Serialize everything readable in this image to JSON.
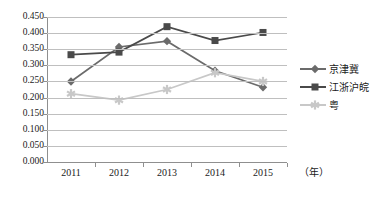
{
  "chart_data": {
    "type": "line",
    "title": "",
    "xlabel": "（年）",
    "ylabel": "",
    "categories": [
      "2011",
      "2012",
      "2013",
      "2014",
      "2015"
    ],
    "ylim": [
      0.0,
      0.45
    ],
    "ytick_labels": [
      "0.450",
      "0.400",
      "0.350",
      "0.300",
      "0.250",
      "0.200",
      "0.150",
      "0.100",
      "0.050",
      "0.000"
    ],
    "ytick_values": [
      0.45,
      0.4,
      0.35,
      0.3,
      0.25,
      0.2,
      0.15,
      0.1,
      0.05,
      0.0
    ],
    "grid": true,
    "legend_position": "right",
    "series": [
      {
        "name": "京津冀",
        "marker": "diamond",
        "color": "#6b6b6b",
        "values": [
          0.25,
          0.357,
          0.375,
          0.283,
          0.232
        ]
      },
      {
        "name": "江浙沪皖",
        "marker": "square",
        "color": "#4a4a4a",
        "values": [
          0.333,
          0.341,
          0.42,
          0.377,
          0.402
        ]
      },
      {
        "name": "粤",
        "marker": "star",
        "color": "#c8c8c8",
        "values": [
          0.212,
          0.192,
          0.225,
          0.277,
          0.25
        ]
      }
    ]
  },
  "axis": {
    "y_labels": [
      "0.450",
      "0.400",
      "0.350",
      "0.300",
      "0.250",
      "0.200",
      "0.150",
      "0.100",
      "0.050",
      "0.000"
    ],
    "x_labels": [
      "2011",
      "2012",
      "2013",
      "2014",
      "2015"
    ],
    "x_unit_label": "（年）"
  },
  "legend": {
    "items": [
      {
        "label": "京津冀"
      },
      {
        "label": "江浙沪皖"
      },
      {
        "label": "粤"
      }
    ]
  },
  "colors": {
    "series1": "#6b6b6b",
    "series2": "#4a4a4a",
    "series3": "#c8c8c8",
    "grid": "#bfbfbf",
    "axis": "#8f8f8f",
    "text": "#1a1a1a"
  }
}
